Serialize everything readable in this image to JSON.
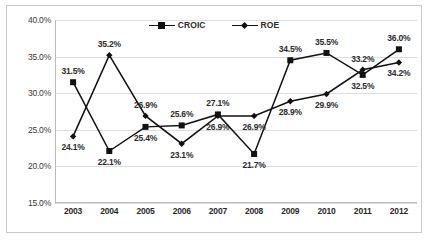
{
  "chart_data": {
    "type": "line",
    "title": "",
    "subtitle": "",
    "xlabel": "",
    "ylabel": "",
    "categories": [
      "2003",
      "2004",
      "2005",
      "2006",
      "2007",
      "2008",
      "2009",
      "2010",
      "2011",
      "2012"
    ],
    "ylim": [
      15.0,
      40.0
    ],
    "y_ticks": [
      15.0,
      20.0,
      25.0,
      30.0,
      35.0,
      40.0
    ],
    "y_tick_labels": [
      "15.0%",
      "20.0%",
      "25.0%",
      "30.0%",
      "35.0%",
      "40.0%"
    ],
    "grid": true,
    "legend_position": "top-center",
    "value_suffix": "%",
    "series": [
      {
        "name": "CROIC",
        "marker": "square",
        "color": "#111111",
        "values": [
          31.5,
          22.1,
          25.4,
          25.6,
          27.1,
          21.7,
          34.5,
          35.5,
          32.5,
          36.0
        ],
        "labels": [
          "31.5%",
          "22.1%",
          "25.4%",
          "25.6%",
          "27.1%",
          "21.7%",
          "34.5%",
          "35.5%",
          "32.5%",
          "36.0%"
        ],
        "label_positions": [
          "above",
          "below",
          "below",
          "above",
          "above",
          "below",
          "above",
          "above",
          "below",
          "above"
        ]
      },
      {
        "name": "ROE",
        "marker": "diamond",
        "color": "#111111",
        "values": [
          24.1,
          35.2,
          26.9,
          23.1,
          26.9,
          26.9,
          28.9,
          29.9,
          33.2,
          34.2
        ],
        "labels": [
          "24.1%",
          "35.2%",
          "26.9%",
          "23.1%",
          "26.9%",
          "26.9%",
          "28.9%",
          "29.9%",
          "33.2%",
          "34.2%"
        ],
        "label_positions": [
          "below",
          "above",
          "above",
          "below",
          "below",
          "below",
          "below",
          "below",
          "above",
          "below"
        ]
      }
    ]
  }
}
